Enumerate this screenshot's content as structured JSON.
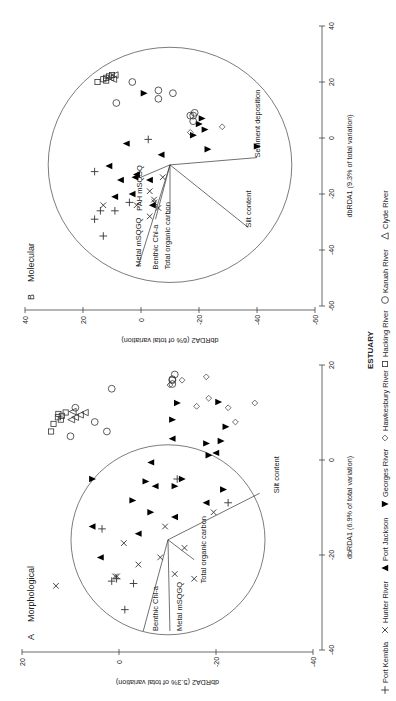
{
  "figure": {
    "rotation_deg": -90,
    "legend_title": "ESTUARY",
    "legend": [
      {
        "name": "Port Kembla",
        "marker": "plus"
      },
      {
        "name": "Hunter River",
        "marker": "cross"
      },
      {
        "name": "Port Jackson",
        "marker": "triangle-up-filled"
      },
      {
        "name": "Georges River",
        "marker": "triangle-down-filled"
      },
      {
        "name": "Hawkesbury River",
        "marker": "diamond-open"
      },
      {
        "name": "Hacking River",
        "marker": "square-open"
      },
      {
        "name": "Karuah River",
        "marker": "circle-open"
      },
      {
        "name": "Clyde River",
        "marker": "triangle-up-open"
      }
    ]
  },
  "chart_data": [
    {
      "type": "scatter",
      "panel_letter": "A",
      "title": "Morphological",
      "xlabel": "dbRDA1 (6.9% of total variation)",
      "ylabel": "dbRDA2 (5.3% of total variation)",
      "xlim": [
        -40,
        20
      ],
      "ylim": [
        -40,
        20
      ],
      "xticks": [
        -40,
        -20,
        0,
        20
      ],
      "yticks": [
        -40,
        -20,
        0,
        20
      ],
      "screen": {
        "x0": 119,
        "sx": -4.85,
        "y0": 460,
        "sy": -4.75
      },
      "circle": {
        "cx": -16.8,
        "cy": -10.1,
        "r": 20
      },
      "vector_origin": [
        -16.8,
        -10.1
      ],
      "vectors": [
        {
          "label": "Benthic Chl-a",
          "end": [
            -36,
            -5
          ],
          "label_at": [
            -36,
            -8
          ]
        },
        {
          "label": "Metal mSQGQ",
          "end": [
            -36,
            -10.5
          ],
          "label_at": [
            -36,
            -13
          ]
        },
        {
          "label": "Total organic carbon",
          "end": [
            -21,
            -15.5
          ],
          "label_at": [
            -26,
            -18
          ]
        },
        {
          "label": "Silt content",
          "end": [
            -7,
            -29
          ],
          "label_at": [
            -7,
            -33
          ]
        }
      ],
      "series": [
        {
          "name": "Port Kembla",
          "marker": "plus",
          "points": [
            [
              -31.5,
              -1.2
            ],
            [
              -25.5,
              1.5
            ],
            [
              -25,
              0.5
            ],
            [
              -26,
              -3
            ],
            [
              -14.5,
              3.5
            ],
            [
              -9,
              -22.5
            ],
            [
              -4,
              -12
            ]
          ]
        },
        {
          "name": "Hunter River",
          "marker": "cross",
          "points": [
            [
              -26.5,
              13
            ],
            [
              -24.5,
              0.4
            ],
            [
              -22,
              -4
            ],
            [
              -20.5,
              -8.5
            ],
            [
              -18.5,
              -13.5
            ],
            [
              -11,
              -19.5
            ],
            [
              -14,
              -9.5
            ],
            [
              -24,
              -11.5
            ],
            [
              -25,
              -15.5
            ],
            [
              -24.5,
              0.8
            ],
            [
              -17.5,
              -1
            ]
          ]
        },
        {
          "name": "Port Jackson",
          "marker": "triangle-up-filled",
          "points": [
            [
              1.5,
              -20
            ],
            [
              -0.5,
              -6.6
            ],
            [
              -9,
              -18
            ],
            [
              -20.5,
              3.8
            ],
            [
              -14,
              5.5
            ],
            [
              -15.5,
              -4
            ],
            [
              -12,
              -11.5
            ],
            [
              -5.5,
              -7.5
            ],
            [
              4.5,
              -11
            ]
          ]
        },
        {
          "name": "Georges River",
          "marker": "triangle-down-filled",
          "points": [
            [
              12,
              -12
            ],
            [
              3.5,
              -18
            ],
            [
              1,
              -18.5
            ],
            [
              -4.5,
              -5.5
            ],
            [
              -4,
              -13
            ],
            [
              -8.5,
              -2.8
            ],
            [
              -11,
              -6.5
            ],
            [
              -4,
              5.5
            ],
            [
              7,
              -22
            ],
            [
              4,
              -21
            ],
            [
              12.2,
              -20.5
            ],
            [
              8.5,
              -11
            ],
            [
              -5.5,
              -11.5
            ],
            [
              -6.2,
              -21.5
            ]
          ]
        },
        {
          "name": "Hawkesbury River",
          "marker": "diamond-open",
          "points": [
            [
              11,
              -22.5
            ],
            [
              8,
              -24
            ],
            [
              12,
              -28
            ],
            [
              16.8,
              -13
            ],
            [
              15.8,
              -10.5
            ],
            [
              17.5,
              -18
            ],
            [
              13,
              -18.5
            ],
            [
              11.3,
              -16
            ]
          ]
        },
        {
          "name": "Hacking River",
          "marker": "square-open",
          "points": [
            [
              6,
              14
            ],
            [
              7.6,
              13.5
            ],
            [
              8.5,
              12
            ],
            [
              9,
              12.6
            ],
            [
              9.7,
              12.5
            ],
            [
              9.3,
              11.8
            ],
            [
              10,
              11
            ]
          ]
        },
        {
          "name": "Karuah River",
          "marker": "circle-open",
          "points": [
            [
              5,
              10
            ],
            [
              8,
              5
            ],
            [
              6,
              2.5
            ],
            [
              11,
              9
            ],
            [
              15,
              1.5
            ],
            [
              16,
              -11
            ],
            [
              16.8,
              -11
            ],
            [
              18,
              -11.5
            ],
            [
              17,
              -11
            ]
          ]
        },
        {
          "name": "Clyde River",
          "marker": "triangle-up-open",
          "points": [
            [
              9,
              9
            ],
            [
              9.5,
              8
            ],
            [
              10,
              7
            ],
            [
              8.5,
              9.8
            ],
            [
              10.2,
              9.5
            ]
          ]
        }
      ]
    },
    {
      "type": "scatter",
      "panel_letter": "B",
      "title": "Molecular",
      "xlabel": "dbRDA1 (9.3% of total variation)",
      "ylabel": "dbRDA2 (6% of total variation)",
      "xlim": [
        -60,
        40
      ],
      "ylim": [
        -60,
        40
      ],
      "xticks": [
        -60,
        -40,
        -20,
        0,
        20,
        40
      ],
      "yticks": [
        -60,
        -40,
        -20,
        0,
        20,
        40
      ],
      "screen": {
        "x0": 141,
        "sx": -2.9,
        "y0": 138,
        "sy": -2.8
      },
      "circle": {
        "cx": -9.6,
        "cy": -10,
        "r": 42
      },
      "vector_origin": [
        -9.6,
        -10
      ],
      "vectors": [
        {
          "label": "Metal mSQGQ",
          "end": [
            -46,
            1
          ],
          "label_at": [
            -46,
            0
          ]
        },
        {
          "label": "Benthic Chl-a",
          "end": [
            -29,
            -5
          ],
          "label_at": [
            -47,
            -6
          ]
        },
        {
          "label": "Total organic carbon",
          "end": [
            -27,
            -10
          ],
          "label_at": [
            -47,
            -10
          ]
        },
        {
          "label": "PAH mSQGQ",
          "end": [
            -14,
            0
          ],
          "label_at": [
            -26,
            -0.5
          ]
        },
        {
          "label": "Silt content",
          "end": [
            -32,
            -37
          ],
          "label_at": [
            -32,
            -38
          ]
        },
        {
          "label": "Sediment deposition",
          "end": [
            -7,
            -40
          ],
          "label_at": [
            -7,
            -41
          ]
        }
      ],
      "series": [
        {
          "name": "Port Kembla",
          "marker": "plus",
          "points": [
            [
              -29,
              16
            ],
            [
              -26,
              14
            ],
            [
              -26,
              9
            ],
            [
              -35,
              13
            ],
            [
              -12,
              16
            ],
            [
              -0.5,
              -2.5
            ],
            [
              -23,
              4
            ]
          ]
        },
        {
          "name": "Hunter River",
          "marker": "cross",
          "points": [
            [
              -24,
              13
            ],
            [
              -19,
              -3
            ],
            [
              -22,
              -4.5
            ],
            [
              -14,
              -7.5
            ],
            [
              -25,
              -6
            ],
            [
              -24,
              1.5
            ],
            [
              -23,
              -4.6
            ],
            [
              -28,
              -3
            ]
          ]
        },
        {
          "name": "Port Jackson",
          "marker": "triangle-up-filled",
          "points": [
            [
              -10,
              11
            ],
            [
              -15,
              7
            ],
            [
              -21,
              9
            ],
            [
              -14,
              2
            ],
            [
              -2,
              5
            ],
            [
              -15,
              -3
            ],
            [
              -13,
              1.5
            ],
            [
              -20,
              3
            ],
            [
              -24,
              -4
            ],
            [
              -6,
              -7
            ]
          ]
        },
        {
          "name": "Georges River",
          "marker": "triangle-down-filled",
          "points": [
            [
              7,
              -21
            ],
            [
              3,
              -22
            ],
            [
              1,
              -18
            ],
            [
              -4,
              -23
            ],
            [
              5,
              -20
            ],
            [
              -3,
              -40
            ],
            [
              16,
              -1
            ]
          ]
        },
        {
          "name": "Hawkesbury River",
          "marker": "diamond-open",
          "points": [
            [
              2,
              -17
            ],
            [
              4,
              -28
            ]
          ]
        },
        {
          "name": "Hacking River",
          "marker": "square-open",
          "points": [
            [
              20,
              15
            ],
            [
              21,
              13
            ],
            [
              21.5,
              12
            ],
            [
              22,
              11
            ],
            [
              22.5,
              10
            ],
            [
              20.5,
              12
            ]
          ]
        },
        {
          "name": "Karuah River",
          "marker": "circle-open",
          "points": [
            [
              12.5,
              8.5
            ],
            [
              20,
              3
            ],
            [
              8,
              -17
            ],
            [
              16,
              -11
            ],
            [
              8,
              -18
            ],
            [
              9,
              -18.5
            ],
            [
              17,
              -6
            ],
            [
              6,
              -18
            ],
            [
              14,
              -6
            ]
          ]
        },
        {
          "name": "Clyde River",
          "marker": "triangle-up-open",
          "points": [
            [
              21,
              9.5
            ],
            [
              22.5,
              9
            ],
            [
              21.5,
              10.5
            ]
          ]
        }
      ]
    }
  ]
}
